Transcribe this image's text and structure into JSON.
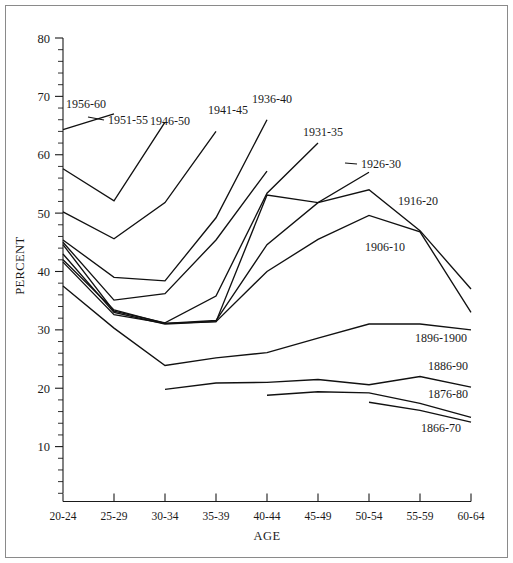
{
  "chart_data": {
    "type": "line",
    "title": "",
    "xlabel": "AGE",
    "ylabel": "PERCENT",
    "categories": [
      "20-24",
      "25-29",
      "30-34",
      "35-39",
      "40-44",
      "45-49",
      "50-54",
      "55-59",
      "60-64"
    ],
    "ylim": [
      0,
      80
    ],
    "yticks": [
      10,
      20,
      30,
      40,
      50,
      60,
      70,
      80
    ],
    "ytick_minor_step": 2,
    "grid": false,
    "legend": "inline-line-labels",
    "line_color": "#111111",
    "background_color": "#ffffff",
    "series": [
      {
        "name": "1956-60",
        "label": "1956-60",
        "x": [
          "20-24",
          "25-29"
        ],
        "values": [
          64.3,
          67.0
        ]
      },
      {
        "name": "1951-55",
        "label": "1951-55",
        "x": [
          "20-24",
          "25-29",
          "30-34"
        ],
        "values": [
          57.6,
          52.1,
          65.6
        ]
      },
      {
        "name": "1946-50",
        "label": "1946-50",
        "x": [
          "20-24",
          "25-29",
          "30-34",
          "35-39"
        ],
        "values": [
          50.2,
          45.6,
          51.8,
          64.0
        ]
      },
      {
        "name": "1941-45",
        "label": "1941-45",
        "x": [
          "20-24",
          "25-29",
          "30-34",
          "35-39",
          "40-44"
        ],
        "values": [
          45.4,
          39.0,
          38.4,
          49.2,
          66.0
        ]
      },
      {
        "name": "1936-40",
        "label": "1936-40",
        "x": [
          "20-24",
          "25-29",
          "30-34",
          "35-39",
          "40-44"
        ],
        "values": [
          45.0,
          35.1,
          36.2,
          45.4,
          57.2
        ]
      },
      {
        "name": "1931-35",
        "label": "1931-35",
        "x": [
          "20-24",
          "25-29",
          "30-34",
          "35-39",
          "40-44",
          "45-49"
        ],
        "values": [
          44.6,
          33.2,
          31.2,
          35.8,
          53.4,
          62.0
        ]
      },
      {
        "name": "1926-30",
        "label": "1926-30",
        "x": [
          "20-24",
          "25-29",
          "30-34",
          "35-39",
          "40-44",
          "45-49",
          "50-54"
        ],
        "values": [
          43.0,
          33.0,
          31.0,
          31.4,
          53.1,
          51.8,
          57.0
        ]
      },
      {
        "name": "1916-20",
        "label": "1916-20",
        "x": [
          "20-24",
          "25-29",
          "30-34",
          "35-39",
          "40-44",
          "45-49",
          "50-54",
          "55-59",
          "60-64"
        ],
        "values": [
          42.0,
          33.4,
          31.1,
          31.6,
          44.6,
          51.8,
          54.0,
          47.0,
          37.0
        ]
      },
      {
        "name": "1906-10",
        "label": "1906-10",
        "x": [
          "20-24",
          "25-29",
          "30-34",
          "35-39",
          "40-44",
          "45-49",
          "50-54",
          "55-59",
          "60-64"
        ],
        "values": [
          41.6,
          32.6,
          31.1,
          31.4,
          40.0,
          45.5,
          49.6,
          46.8,
          33.0
        ]
      },
      {
        "name": "1896-1900",
        "label": "1896-1900",
        "x": [
          "20-24",
          "25-29",
          "30-34",
          "35-39",
          "40-44",
          "45-49",
          "50-54",
          "55-59",
          "60-64"
        ],
        "values": [
          37.5,
          30.3,
          23.9,
          25.2,
          26.1,
          28.6,
          31.0,
          31.0,
          30.0
        ]
      },
      {
        "name": "1886-90",
        "label": "1886-90",
        "x": [
          "30-34",
          "35-39",
          "40-44",
          "45-49",
          "50-54",
          "55-59",
          "60-64"
        ],
        "values": [
          19.8,
          20.9,
          21.0,
          21.5,
          20.6,
          22.0,
          20.2
        ]
      },
      {
        "name": "1876-80",
        "label": "1876-80",
        "x": [
          "40-44",
          "45-49",
          "50-54",
          "55-59",
          "60-64"
        ],
        "values": [
          18.8,
          19.4,
          19.2,
          17.4,
          15.0
        ]
      },
      {
        "name": "1866-70",
        "label": "1866-70",
        "x": [
          "50-54",
          "55-59",
          "60-64"
        ],
        "values": [
          17.6,
          16.2,
          14.2
        ]
      }
    ]
  },
  "annotations": {
    "labels": [
      {
        "text": "1956-60",
        "for": "1956-60"
      },
      {
        "text": "1951-55",
        "for": "1951-55"
      },
      {
        "text": "1946-50",
        "for": "1946-50"
      },
      {
        "text": "1941-45",
        "for": "1941-45"
      },
      {
        "text": "1936-40",
        "for": "1936-40"
      },
      {
        "text": "1931-35",
        "for": "1931-35"
      },
      {
        "text": "1926-30",
        "for": "1926-30"
      },
      {
        "text": "1916-20",
        "for": "1916-20"
      },
      {
        "text": "1906-10",
        "for": "1906-10"
      },
      {
        "text": "1896-1900",
        "for": "1896-1900"
      },
      {
        "text": "1886-90",
        "for": "1886-90"
      },
      {
        "text": "1876-80",
        "for": "1876-80"
      },
      {
        "text": "1866-70",
        "for": "1866-70"
      }
    ]
  }
}
